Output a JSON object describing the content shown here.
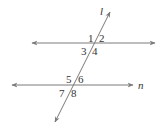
{
  "diagram": {
    "type": "parallel-lines-cut-by-transversal",
    "line_color": "#7a7a7a",
    "text_color": "#333333",
    "transversal": {
      "label": "l",
      "x1": 55,
      "y1": 122,
      "x2": 110,
      "y2": 12
    },
    "upper_line": {
      "label": "",
      "y": 43,
      "x1": 32,
      "x2": 155
    },
    "lower_line": {
      "label": "n",
      "y": 85,
      "x1": 12,
      "x2": 133
    },
    "angles": [
      {
        "label": "1",
        "x": 88,
        "y": 39
      },
      {
        "label": "2",
        "x": 99,
        "y": 39
      },
      {
        "label": "3",
        "x": 82,
        "y": 54
      },
      {
        "label": "4",
        "x": 93,
        "y": 54
      },
      {
        "label": "5",
        "x": 66,
        "y": 81
      },
      {
        "label": "6",
        "x": 78,
        "y": 81
      },
      {
        "label": "7",
        "x": 60,
        "y": 96
      },
      {
        "label": "8",
        "x": 72,
        "y": 96
      }
    ]
  }
}
